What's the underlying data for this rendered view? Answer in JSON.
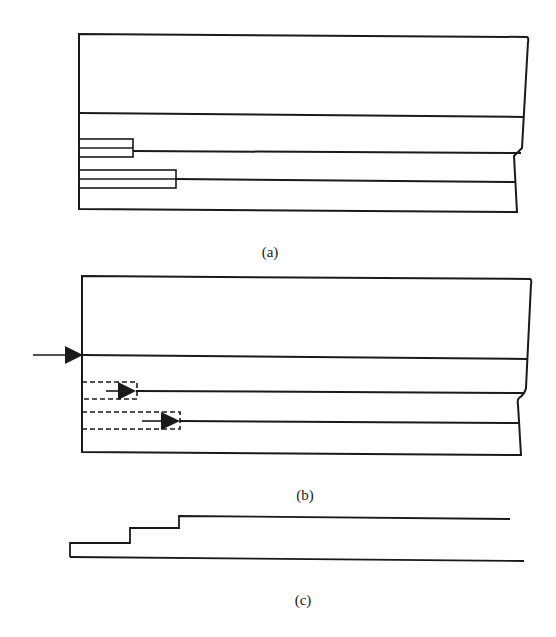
{
  "figure": {
    "panels": [
      {
        "id": "a",
        "caption": "(a)",
        "description": "Cross-section with a top horizontal divider and two rectangular stepped inserts on the left edge; right edge has a notch",
        "caption_pos": {
          "x": 270,
          "y": 244
        }
      },
      {
        "id": "b",
        "caption": "(b)",
        "description": "Same cross-section with arrow entering at main divider and two dashed rectangles with arrows advancing along lower lines",
        "caption_pos": {
          "x": 305,
          "y": 487
        }
      },
      {
        "id": "c",
        "caption": "(c)",
        "description": "Stepped profile: three steps rising left to right above a straight baseline",
        "caption_pos": {
          "x": 303,
          "y": 592
        }
      }
    ],
    "colors": {
      "stroke": "#1a1a1a",
      "background": "#ffffff"
    }
  }
}
